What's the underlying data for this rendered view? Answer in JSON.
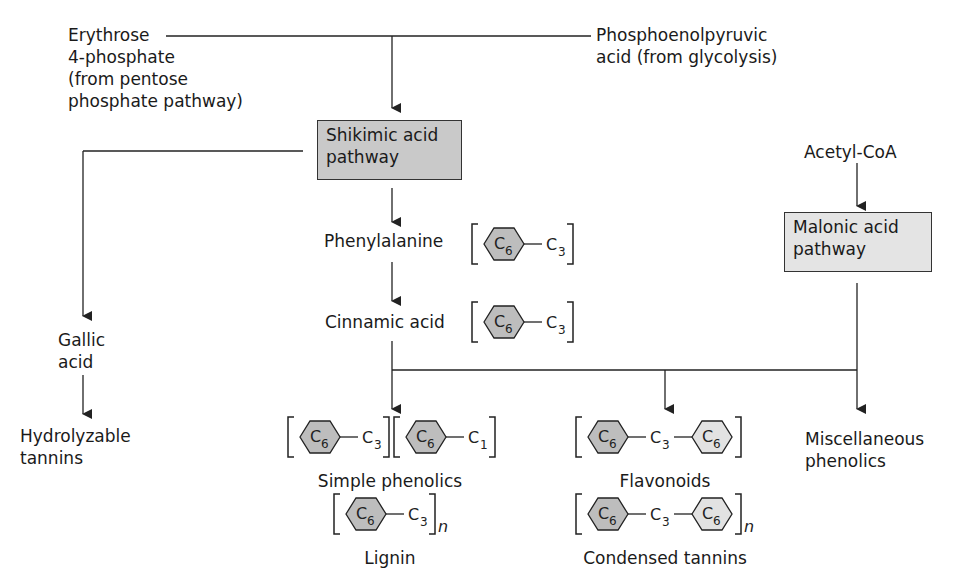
{
  "diagram": {
    "inputs": {
      "erythrose": [
        "Erythrose",
        "4-phosphate",
        "(from pentose",
        "phosphate pathway)"
      ],
      "pep": [
        "Phosphoenolpyruvic",
        "acid (from glycolysis)"
      ],
      "acetyl": "Acetyl-CoA"
    },
    "pathways": {
      "shikimic": [
        "Shikimic acid",
        "pathway"
      ],
      "malonic": [
        "Malonic acid",
        "pathway"
      ]
    },
    "intermediates": {
      "phenylalanine": "Phenylalanine",
      "cinnamic": "Cinnamic acid",
      "gallic": [
        "Gallic",
        "acid"
      ]
    },
    "products": {
      "hydrolyzable": [
        "Hydrolyzable",
        "tannins"
      ],
      "simple": "Simple phenolics",
      "lignin": "Lignin",
      "flavonoids": "Flavonoids",
      "condensed": "Condensed tannins",
      "misc": [
        "Miscellaneous",
        "phenolics"
      ]
    },
    "formula_tokens": {
      "ring": "C",
      "ring_sub": "6",
      "c": "C",
      "c3_sub": "3",
      "c1_sub": "1",
      "n": "n"
    },
    "colors": {
      "shikimic_fill": "#c9c9c9",
      "malonic_fill": "#e4e4e4",
      "ring_dark": "#bdbdbd",
      "ring_light": "#e2e2e2",
      "line": "#222222"
    }
  }
}
